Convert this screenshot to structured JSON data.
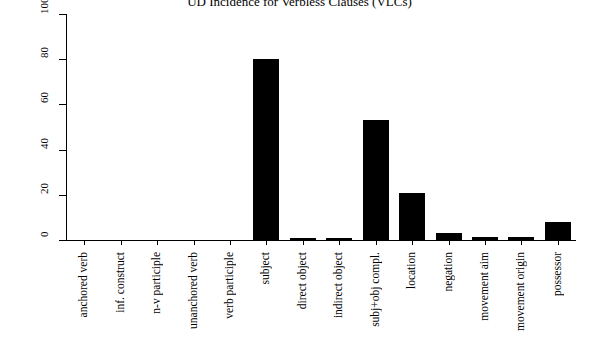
{
  "chart_data": {
    "type": "bar",
    "title": "UD Incidence for Verbless Clauses (VLCs)",
    "xlabel": "",
    "ylabel": "",
    "ylim": [
      0,
      100
    ],
    "yticks": [
      0,
      20,
      40,
      60,
      80,
      100
    ],
    "grid": false,
    "legend": null,
    "categories": [
      "anchored verb",
      "inf. construct",
      "n-v participle",
      "unanchored verb",
      "verb participle",
      "subject",
      "direct object",
      "indirect object",
      "subj+obj compl.",
      "location",
      "negation",
      "movement aim",
      "movement origin",
      "possessor"
    ],
    "values": [
      0,
      0,
      0,
      0,
      0,
      80,
      0.7,
      0.7,
      53,
      21,
      3,
      1.5,
      1.5,
      8
    ]
  }
}
